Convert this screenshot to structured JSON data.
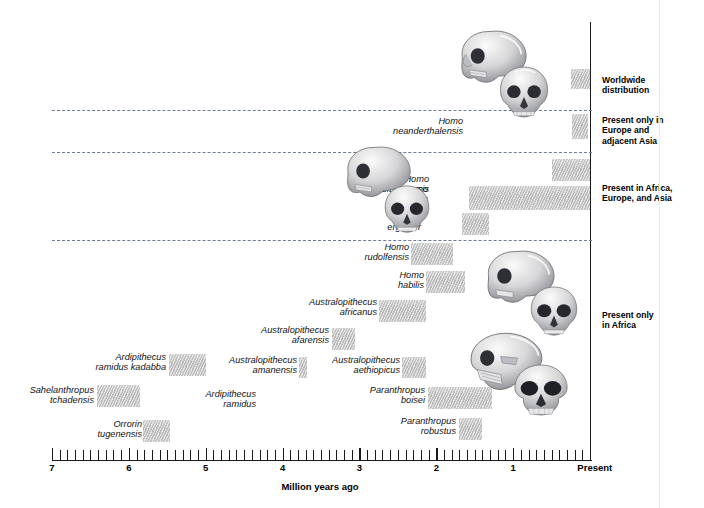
{
  "axis": {
    "title": "Million years ago",
    "ticks": [
      {
        "value": 7,
        "label": "7"
      },
      {
        "value": 6,
        "label": "6"
      },
      {
        "value": 5,
        "label": "5"
      },
      {
        "value": 4,
        "label": "4"
      },
      {
        "value": 3,
        "label": "3"
      },
      {
        "value": 2,
        "label": "2"
      },
      {
        "value": 1,
        "label": "1"
      },
      {
        "value": 0,
        "label": "Present"
      }
    ],
    "min": 0,
    "max": 7,
    "minor_tick_step": 0.1
  },
  "range_labels": [
    {
      "id": "worldwide",
      "text": "Worldwide\ndistribution"
    },
    {
      "id": "europe-asia",
      "text": "Present only in\nEurope and\nadjacent Asia"
    },
    {
      "id": "africa-europe-asia",
      "text": "Present in Africa,\nEurope, and Asia"
    },
    {
      "id": "africa-only",
      "text": "Present only\nin Africa"
    }
  ],
  "chart_data": {
    "type": "bar",
    "title": "",
    "xlabel": "Million years ago",
    "ylabel": "",
    "xlim": [
      7,
      0
    ],
    "grid": false,
    "legend": "none",
    "orientation": "horizontal-ranges",
    "note": "Horizontal range (Gantt-style) bars: each hominin species spans a first-appearance to last-appearance interval in millions of years ago.",
    "categories": [
      "Homo sapiens",
      "Homo neanderthalensis",
      "Homo heidelbergensis",
      "Homo erectus",
      "Homo ergaster",
      "Homo rudolfensis",
      "Homo habilis",
      "Australopithecus africanus",
      "Australopithecus afarensis",
      "Australopithecus amanensis",
      "Australopithecus aethiopicus",
      "Ardipithecus ramidus kadabba",
      "Ardipithecus ramidus",
      "Sahelanthropus tchadensis",
      "Orrorin tugenensis",
      "Paranthropus boisei",
      "Paranthropus robustus"
    ],
    "bars": [
      {
        "species": "Homo sapiens",
        "label": "Homo\nsapiens",
        "start_mya": 0.25,
        "end_mya": 0.0
      },
      {
        "species": "Homo neanderthalensis",
        "label": "Homo\nneanderthalensis",
        "start_mya": 0.23,
        "end_mya": 0.03
      },
      {
        "species": "Homo heidelbergensis",
        "label": "Homo\nheidelbergensis",
        "start_mya": 0.5,
        "end_mya": 0.0
      },
      {
        "species": "Homo erectus",
        "label": "Homo\nerectus",
        "start_mya": 1.58,
        "end_mya": 0.0
      },
      {
        "species": "Homo ergaster",
        "label": "Homo\nergaster",
        "start_mya": 1.66,
        "end_mya": 1.31
      },
      {
        "species": "Homo rudolfensis",
        "label": "Homo\nrudolfensis",
        "start_mya": 2.33,
        "end_mya": 1.78
      },
      {
        "species": "Homo habilis",
        "label": "Homo\nhabilis",
        "start_mya": 2.13,
        "end_mya": 1.62
      },
      {
        "species": "Australopithecus africanus",
        "label": "Australopithecus\nafricanus",
        "start_mya": 2.75,
        "end_mya": 2.13
      },
      {
        "species": "Australopithecus afarensis",
        "label": "Australopithecus\nafarensis",
        "start_mya": 3.36,
        "end_mya": 3.06
      },
      {
        "species": "Australopithecus amanensis",
        "label": "Australopithecus\namanensis",
        "start_mya": 3.79,
        "end_mya": 3.68
      },
      {
        "species": "Australopithecus aethiopicus",
        "label": "Australopithecus\naethiopicus",
        "start_mya": 2.44,
        "end_mya": 2.13
      },
      {
        "species": "Ardipithecus ramidus kadabba",
        "label": "Ardipithecus\nramidus kadabba",
        "start_mya": 5.48,
        "end_mya": 5.0
      },
      {
        "species": "Ardipithecus ramidus",
        "label": "Ardipithecus\nramidus",
        "start_mya": null,
        "end_mya": null
      },
      {
        "species": "Sahelanthropus tchadensis",
        "label": "Sahelanthropus\ntchadensis",
        "start_mya": 6.42,
        "end_mya": 5.86
      },
      {
        "species": "Orrorin tugenensis",
        "label": "Orrorin\ntugenensis",
        "start_mya": 5.81,
        "end_mya": 5.47
      },
      {
        "species": "Paranthropus boisei",
        "label": "Paranthropus\nboisei",
        "start_mya": 2.11,
        "end_mya": 1.28
      },
      {
        "species": "Paranthropus robustus",
        "label": "Paranthropus\nrobustus",
        "start_mya": 1.71,
        "end_mya": 1.4
      }
    ]
  },
  "skulls": [
    {
      "id": "homo-sapiens-skull-profile",
      "kind": "profile"
    },
    {
      "id": "homo-neanderthalensis-skull-front",
      "kind": "front"
    },
    {
      "id": "homo-erectus-skull-profile",
      "kind": "profile"
    },
    {
      "id": "homo-ergaster-skull-front",
      "kind": "front"
    },
    {
      "id": "homo-habilis-skull-profile",
      "kind": "profile"
    },
    {
      "id": "homo-habilis-skull-front",
      "kind": "front"
    },
    {
      "id": "paranthropus-boisei-skull-profile",
      "kind": "profile"
    },
    {
      "id": "paranthropus-boisei-skull-front",
      "kind": "front"
    }
  ]
}
